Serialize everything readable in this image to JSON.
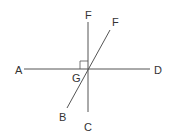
{
  "diagram": {
    "type": "geometry-intersecting-lines",
    "colors": {
      "line": "#555555",
      "label": "#333333",
      "background": "#ffffff"
    },
    "lines": [
      {
        "name": "line-AD",
        "from": [
          24,
          69
        ],
        "to": [
          150,
          69
        ]
      },
      {
        "name": "line-FC",
        "from": [
          88,
          22
        ],
        "to": [
          88,
          112
        ]
      },
      {
        "name": "line-FB",
        "from": [
          110,
          30
        ],
        "to": [
          67,
          108
        ]
      }
    ],
    "right_angle_marker": {
      "at": "G",
      "x": 80,
      "y": 61,
      "size": 8
    },
    "labels": [
      {
        "id": "A",
        "text": "A",
        "x": 15,
        "y": 74
      },
      {
        "id": "D",
        "text": "D",
        "x": 154,
        "y": 74
      },
      {
        "id": "F-top",
        "text": "F",
        "x": 85,
        "y": 19
      },
      {
        "id": "F-diag",
        "text": "F",
        "x": 112,
        "y": 26
      },
      {
        "id": "G",
        "text": "G",
        "x": 72,
        "y": 82
      },
      {
        "id": "B",
        "text": "B",
        "x": 59,
        "y": 121
      },
      {
        "id": "C",
        "text": "C",
        "x": 84,
        "y": 131
      }
    ]
  }
}
